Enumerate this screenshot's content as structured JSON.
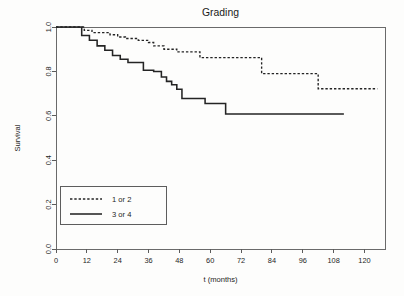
{
  "figure": {
    "title": "Grading",
    "background_color": "#fdfdfc",
    "line_color": "#242424",
    "axis_color": "#5b5b5b"
  },
  "axes": {
    "x_title": "t (months)",
    "y_title": "Survival",
    "x_ticks": [
      "0",
      "12",
      "24",
      "36",
      "48",
      "60",
      "72",
      "84",
      "96",
      "108",
      "120"
    ],
    "y_ticks": [
      "0.0",
      "0.2",
      "0.4",
      "0.6",
      "0.8",
      "1.0"
    ],
    "x_min": 0,
    "x_max": 128,
    "y_min": 0.0,
    "y_max": 1.0
  },
  "legend": {
    "position": "bottom-left",
    "entries": [
      {
        "label": "1 or 2",
        "style": "dashed"
      },
      {
        "label": "3 or 4",
        "style": "solid"
      }
    ]
  },
  "chart_data": {
    "type": "line",
    "title": "Grading",
    "xlabel": "t (months)",
    "ylabel": "Survival",
    "xlim": [
      0,
      128
    ],
    "ylim": [
      0.0,
      1.0
    ],
    "grid": false,
    "legend_position": "bottom-left",
    "x_ticks": [
      0,
      12,
      24,
      36,
      48,
      60,
      72,
      84,
      96,
      108,
      120
    ],
    "y_ticks": [
      0.0,
      0.2,
      0.4,
      0.6,
      0.8,
      1.0
    ],
    "step_type": "post",
    "series": [
      {
        "name": "1 or 2",
        "style": "dashed",
        "x": [
          0,
          9,
          11,
          14,
          21,
          24,
          27,
          32,
          36,
          38,
          42,
          47,
          50,
          56,
          72,
          80,
          96,
          102,
          125
        ],
        "y": [
          1.0,
          1.0,
          0.985,
          0.975,
          0.965,
          0.955,
          0.948,
          0.94,
          0.93,
          0.915,
          0.9,
          0.888,
          0.888,
          0.862,
          0.862,
          0.79,
          0.79,
          0.722,
          0.722
        ]
      },
      {
        "name": "3 or 4",
        "style": "solid",
        "x": [
          0,
          8,
          10,
          13,
          16,
          19,
          22,
          25,
          28,
          31,
          34,
          38,
          41,
          43,
          45,
          47,
          49,
          54,
          58,
          63,
          66,
          112
        ],
        "y": [
          1.0,
          1.0,
          0.962,
          0.94,
          0.915,
          0.895,
          0.872,
          0.855,
          0.84,
          0.84,
          0.805,
          0.8,
          0.775,
          0.755,
          0.74,
          0.72,
          0.678,
          0.678,
          0.655,
          0.655,
          0.608,
          0.608
        ]
      }
    ]
  }
}
